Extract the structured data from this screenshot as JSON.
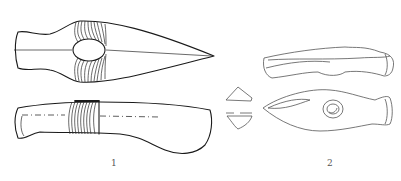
{
  "figure": {
    "items": [
      {
        "label": "1",
        "description": "axe-head, top view and side view with binding wraps"
      },
      {
        "label": "2",
        "description": "perforated axe-head, side view, top view and cross-sections"
      }
    ]
  },
  "colors": {
    "line": "#1a1a1a",
    "background": "#ffffff",
    "label": "#555555"
  }
}
